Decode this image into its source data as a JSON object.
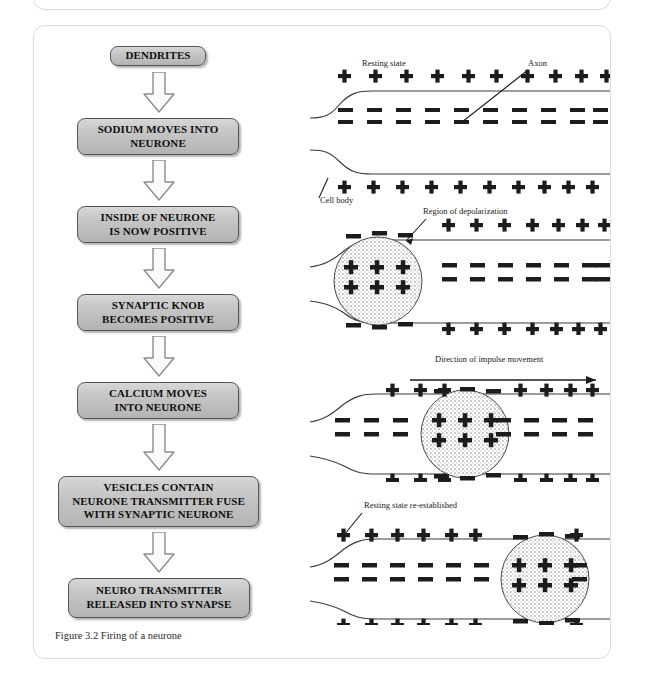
{
  "figure": {
    "caption": "Figure 3.2  Firing of a neurone"
  },
  "flowchart": {
    "steps": [
      {
        "label": "DENDRITES",
        "lines": [
          "DENDRITES"
        ]
      },
      {
        "label": "SODIUM MOVES INTO NEURONE",
        "lines": [
          "SODIUM MOVES INTO",
          "NEURONE"
        ]
      },
      {
        "label": "INSIDE OF NEURONE IS NOW POSITIVE",
        "lines": [
          "INSIDE OF NEURONE",
          "IS NOW POSITIVE"
        ]
      },
      {
        "label": "SYNAPTIC KNOB BECOMES POSITIVE",
        "lines": [
          "SYNAPTIC KNOB",
          "BECOMES POSITIVE"
        ]
      },
      {
        "label": "CALCIUM MOVES INTO NEURONE",
        "lines": [
          "CALCIUM MOVES",
          "INTO NEURONE"
        ]
      },
      {
        "label": "VESICLES CONTAIN NEURONE TRANSMITTER FUSE WITH SYNAPTIC NEURONE",
        "lines": [
          "VESICLES CONTAIN",
          "NEURONE TRANSMITTER FUSE",
          "WITH SYNAPTIC NEURONE"
        ]
      },
      {
        "label": "NEURO TRANSMITTER RELEASED INTO SYNAPSE",
        "lines": [
          "NEURO TRANSMITTER",
          "RELEASED INTO SYNAPSE"
        ]
      }
    ],
    "connector": "down-block-arrow"
  },
  "neuron_panels": [
    {
      "name": "resting-state",
      "title": "Resting state",
      "labels": [
        "Resting state",
        "Axon",
        "Cell body"
      ],
      "charge_outside_top": "+",
      "charge_inside": "–",
      "charge_outside_bottom": "+",
      "depolarized_region": false
    },
    {
      "name": "depolarization-start",
      "title": "Region of depolarization",
      "labels": [
        "Region of depolarization"
      ],
      "charge_outside_top": "+",
      "charge_inside": "–",
      "charge_outside_bottom": "+",
      "depolarized_region": true,
      "region_position": "left"
    },
    {
      "name": "impulse-travelling",
      "title": "Direction of impulse movement",
      "labels": [
        "Direction of impulse movement"
      ],
      "charge_outside_top": "+",
      "charge_inside": "–",
      "charge_outside_bottom": "+",
      "depolarized_region": true,
      "region_position": "middle"
    },
    {
      "name": "resting-state-re-established",
      "title": "Resting state re-established",
      "labels": [
        "Resting state re-established"
      ],
      "charge_outside_top": "+",
      "charge_inside": "–",
      "charge_outside_bottom": "+",
      "depolarized_region": true,
      "region_position": "right"
    }
  ],
  "colors": {
    "box_fill_light": "#d6d6d6",
    "box_fill_dark": "#b4b4b4",
    "box_border": "#555555",
    "frame_border": "#dcdcdc",
    "ink": "#1a1a1a",
    "page_background": "#ffffff"
  }
}
